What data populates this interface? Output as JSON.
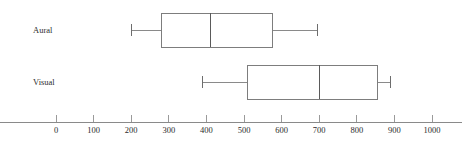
{
  "chart_data": {
    "type": "box",
    "title": "",
    "xlabel": "",
    "ylabel": "",
    "orientation": "horizontal",
    "xlim": [
      -150,
      1080
    ],
    "xticks": [
      0,
      100,
      200,
      300,
      400,
      500,
      600,
      700,
      800,
      900,
      1000
    ],
    "xtick_labels": [
      "0",
      "100",
      "200",
      "300",
      "400",
      "500",
      "600",
      "700",
      "800",
      "900",
      "1000"
    ],
    "grid": false,
    "legend": "none",
    "categories": [
      "Aural",
      "Visual"
    ],
    "boxes": [
      {
        "label": "Aural",
        "min": 200,
        "q1": 280,
        "median": 410,
        "q3": 575,
        "max": 695
      },
      {
        "label": "Visual",
        "min": 390,
        "q1": 510,
        "median": 700,
        "q3": 855,
        "max": 890
      }
    ],
    "colors": {
      "box_stroke": "#7d7d7d",
      "median_stroke": "#5a5a5a",
      "whisker_stroke": "#8a8a8a",
      "axis_stroke": "#8a8a8a",
      "text": "#2b2b2b",
      "background": "#ffffff"
    }
  }
}
